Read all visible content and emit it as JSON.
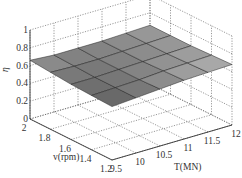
{
  "chart_data": {
    "type": "surface",
    "title": "",
    "xlabel": "T(MN)",
    "ylabel": "v(rpm)",
    "zlabel": "η",
    "x_ticks": [
      "9.5",
      "10",
      "10.5",
      "11",
      "11.5",
      "12"
    ],
    "y_ticks": [
      "1.2",
      "1.4",
      "1.6",
      "1.8",
      "2"
    ],
    "z_ticks": [
      "0",
      "0.2",
      "0.4",
      "0.6",
      "0.8",
      "1"
    ],
    "xlim": [
      9.5,
      12
    ],
    "ylim": [
      1.2,
      2
    ],
    "zlim": [
      0,
      1
    ],
    "grid": true,
    "colormap": "gray",
    "x": [
      9.5,
      10,
      10.5,
      11,
      11.5,
      12
    ],
    "y": [
      1.2,
      1.4,
      1.6,
      1.8,
      2.0
    ],
    "z": [
      [
        0.6,
        0.62,
        0.64,
        0.66,
        0.67,
        0.68
      ],
      [
        0.61,
        0.62,
        0.63,
        0.65,
        0.66,
        0.67
      ],
      [
        0.62,
        0.62,
        0.63,
        0.64,
        0.65,
        0.66
      ],
      [
        0.64,
        0.63,
        0.63,
        0.64,
        0.65,
        0.66
      ],
      [
        0.66,
        0.64,
        0.64,
        0.64,
        0.65,
        0.66
      ]
    ]
  }
}
